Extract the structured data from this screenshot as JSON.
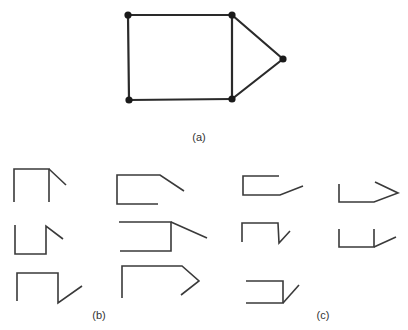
{
  "figure": {
    "graph_a": {
      "label": "(a)",
      "vertices": [
        {
          "id": "v1",
          "x": 128,
          "y": 15
        },
        {
          "id": "v2",
          "x": 232,
          "y": 15
        },
        {
          "id": "v3",
          "x": 283,
          "y": 59
        },
        {
          "id": "v4",
          "x": 232,
          "y": 99
        },
        {
          "id": "v5",
          "x": 129,
          "y": 100
        }
      ],
      "edges": [
        [
          "v1",
          "v2"
        ],
        [
          "v2",
          "v3"
        ],
        [
          "v3",
          "v4"
        ],
        [
          "v4",
          "v5"
        ],
        [
          "v5",
          "v1"
        ],
        [
          "v2",
          "v4"
        ]
      ]
    },
    "group_b": {
      "label": "(b)",
      "pieces": [
        {
          "paths": [
            "14,202 14,169 49,169 49,202",
            "49,169 66,185"
          ]
        },
        {
          "paths": [
            "158,204 117,204 117,175 160,175 184,191"
          ]
        },
        {
          "paths": [
            "15,225 15,254 46,254 46,226 63,239"
          ]
        },
        {
          "paths": [
            "119,222 171,222 171,251 120,251",
            "171,222 207,238"
          ]
        },
        {
          "paths": [
            "17,301 17,273 58,273 58,303 82,286"
          ]
        },
        {
          "paths": [
            "122,298 122,266 182,266 199,281 181,295"
          ]
        }
      ]
    },
    "group_c": {
      "label": "(c)",
      "pieces": [
        {
          "paths": [
            "279,176 243,176 243,195 280,195 303,186"
          ]
        },
        {
          "paths": [
            "339,184 339,202 374,202 398,193 375,182"
          ]
        },
        {
          "paths": [
            "242,242 242,223 278,223 279,243 290,231"
          ]
        },
        {
          "paths": [
            "339,229 339,247 374,247 374,229",
            "374,247 396,237"
          ]
        },
        {
          "paths": [
            "246,281 283,281 283,303 246,303",
            "283,303 299,285"
          ]
        }
      ]
    }
  }
}
